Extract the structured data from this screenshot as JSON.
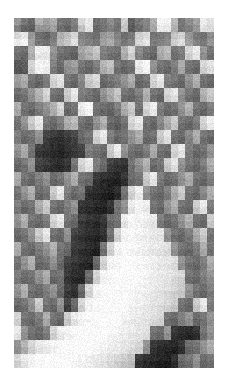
{
  "figure": {
    "kind": "grayscale-raster-heatmap",
    "background_color": "#ffffff",
    "origin_x_px": 14,
    "origin_y_px": 18,
    "width_px": 200,
    "height_px": 350,
    "cell_width_px": 7.14,
    "cell_height_px": 7.0,
    "columns": 28,
    "rows": 50,
    "noise_amplitude": 14,
    "title": "",
    "caption": "",
    "axis_labels": [],
    "tick_labels": [],
    "legend": []
  },
  "chart_data": {
    "type": "heatmap",
    "title": "",
    "xlabel": "",
    "ylabel": "",
    "colormap": "gray",
    "vmin": 0,
    "vmax": 255,
    "grid": false,
    "legend_position": "none",
    "xticklabels": [],
    "yticklabels": [],
    "ncols": 28,
    "nrows": 50,
    "note": "Grayscale intensity values 0-255 per cell; 0 = black, 255 = white.",
    "values": [
      [
        150,
        120,
        105,
        180,
        160,
        175,
        120,
        110,
        130,
        215,
        235,
        110,
        120,
        140,
        120,
        205,
        95,
        120,
        135,
        175,
        245,
        240,
        185,
        120,
        140,
        160,
        235,
        225
      ],
      [
        130,
        100,
        95,
        150,
        145,
        160,
        110,
        100,
        120,
        190,
        225,
        105,
        115,
        130,
        115,
        195,
        90,
        110,
        125,
        165,
        235,
        230,
        175,
        115,
        130,
        150,
        225,
        215
      ],
      [
        215,
        230,
        150,
        110,
        100,
        120,
        175,
        190,
        215,
        130,
        120,
        110,
        150,
        160,
        130,
        110,
        120,
        205,
        220,
        115,
        120,
        130,
        195,
        210,
        150,
        120,
        110,
        140
      ],
      [
        235,
        240,
        160,
        120,
        110,
        130,
        185,
        200,
        225,
        140,
        130,
        120,
        160,
        170,
        140,
        120,
        130,
        215,
        230,
        125,
        130,
        140,
        205,
        220,
        160,
        130,
        120,
        150
      ],
      [
        120,
        110,
        180,
        240,
        235,
        150,
        120,
        110,
        105,
        165,
        180,
        200,
        130,
        120,
        115,
        180,
        215,
        140,
        120,
        110,
        175,
        190,
        120,
        130,
        215,
        235,
        150,
        120
      ],
      [
        110,
        100,
        170,
        230,
        225,
        140,
        110,
        100,
        95,
        155,
        170,
        190,
        120,
        110,
        105,
        170,
        205,
        130,
        110,
        100,
        165,
        180,
        110,
        120,
        205,
        225,
        140,
        110
      ],
      [
        90,
        95,
        215,
        245,
        240,
        130,
        110,
        150,
        160,
        120,
        110,
        130,
        180,
        195,
        120,
        110,
        120,
        235,
        245,
        150,
        120,
        110,
        130,
        175,
        120,
        110,
        215,
        230
      ],
      [
        85,
        90,
        205,
        240,
        235,
        120,
        100,
        140,
        150,
        110,
        100,
        120,
        170,
        185,
        110,
        100,
        110,
        225,
        240,
        140,
        110,
        100,
        120,
        165,
        110,
        100,
        205,
        220
      ],
      [
        160,
        175,
        120,
        110,
        130,
        215,
        230,
        120,
        110,
        140,
        205,
        220,
        110,
        120,
        130,
        150,
        175,
        110,
        120,
        215,
        235,
        130,
        120,
        110,
        150,
        180,
        120,
        110
      ],
      [
        150,
        165,
        110,
        100,
        120,
        205,
        220,
        110,
        100,
        130,
        195,
        210,
        100,
        110,
        120,
        140,
        165,
        100,
        110,
        205,
        225,
        120,
        110,
        100,
        140,
        170,
        110,
        100
      ],
      [
        110,
        120,
        150,
        180,
        215,
        120,
        110,
        205,
        235,
        130,
        120,
        110,
        150,
        175,
        200,
        120,
        110,
        130,
        180,
        120,
        110,
        215,
        230,
        150,
        120,
        110,
        180,
        205
      ],
      [
        100,
        110,
        140,
        170,
        205,
        110,
        100,
        195,
        225,
        120,
        110,
        100,
        140,
        165,
        190,
        110,
        100,
        120,
        170,
        110,
        100,
        205,
        220,
        140,
        110,
        100,
        170,
        195
      ],
      [
        175,
        120,
        110,
        130,
        150,
        180,
        215,
        110,
        120,
        235,
        245,
        120,
        110,
        105,
        130,
        175,
        205,
        120,
        215,
        240,
        130,
        110,
        120,
        150,
        180,
        120,
        110,
        130
      ],
      [
        165,
        110,
        100,
        120,
        140,
        170,
        205,
        100,
        110,
        225,
        240,
        110,
        100,
        95,
        120,
        165,
        195,
        110,
        205,
        230,
        120,
        100,
        110,
        140,
        170,
        110,
        100,
        120
      ],
      [
        120,
        150,
        205,
        235,
        120,
        110,
        130,
        175,
        190,
        120,
        110,
        150,
        180,
        110,
        100,
        120,
        215,
        235,
        120,
        110,
        140,
        175,
        205,
        120,
        110,
        130,
        215,
        240
      ],
      [
        110,
        140,
        195,
        225,
        110,
        100,
        120,
        165,
        180,
        110,
        100,
        140,
        170,
        100,
        90,
        110,
        205,
        225,
        110,
        100,
        130,
        165,
        195,
        110,
        100,
        120,
        205,
        230
      ],
      [
        130,
        110,
        120,
        150,
        70,
        60,
        55,
        65,
        75,
        110,
        120,
        215,
        235,
        130,
        110,
        120,
        150,
        175,
        110,
        120,
        205,
        230,
        120,
        110,
        140,
        175,
        120,
        110
      ],
      [
        120,
        100,
        110,
        140,
        60,
        50,
        45,
        55,
        65,
        100,
        110,
        205,
        225,
        120,
        100,
        110,
        140,
        165,
        100,
        110,
        195,
        220,
        110,
        100,
        130,
        165,
        110,
        100
      ],
      [
        150,
        175,
        120,
        65,
        55,
        45,
        40,
        50,
        60,
        70,
        130,
        120,
        110,
        205,
        235,
        150,
        120,
        110,
        130,
        175,
        120,
        110,
        215,
        235,
        130,
        110,
        120,
        150
      ],
      [
        140,
        165,
        110,
        55,
        45,
        40,
        35,
        45,
        55,
        65,
        120,
        110,
        100,
        195,
        225,
        140,
        110,
        100,
        120,
        165,
        110,
        100,
        205,
        225,
        120,
        100,
        110,
        140
      ],
      [
        110,
        120,
        150,
        70,
        60,
        50,
        45,
        55,
        120,
        215,
        235,
        130,
        110,
        70,
        60,
        55,
        120,
        150,
        180,
        110,
        120,
        205,
        230,
        150,
        120,
        110,
        130,
        175
      ],
      [
        100,
        110,
        140,
        60,
        50,
        45,
        40,
        50,
        110,
        205,
        225,
        120,
        100,
        60,
        50,
        45,
        110,
        140,
        170,
        100,
        110,
        195,
        220,
        140,
        110,
        100,
        120,
        165
      ],
      [
        175,
        120,
        110,
        130,
        150,
        110,
        120,
        150,
        180,
        120,
        110,
        60,
        50,
        45,
        40,
        55,
        110,
        120,
        205,
        235,
        130,
        110,
        120,
        150,
        175,
        120,
        110,
        130
      ],
      [
        165,
        110,
        100,
        120,
        140,
        100,
        110,
        140,
        170,
        110,
        100,
        50,
        40,
        35,
        30,
        45,
        100,
        110,
        195,
        225,
        120,
        100,
        110,
        140,
        165,
        110,
        100,
        120
      ],
      [
        120,
        150,
        180,
        110,
        120,
        205,
        235,
        130,
        110,
        120,
        55,
        45,
        40,
        35,
        50,
        120,
        215,
        240,
        150,
        120,
        110,
        130,
        175,
        205,
        120,
        110,
        140,
        175
      ],
      [
        110,
        140,
        170,
        100,
        110,
        195,
        225,
        120,
        100,
        110,
        45,
        35,
        30,
        25,
        40,
        110,
        205,
        230,
        140,
        110,
        100,
        120,
        165,
        195,
        110,
        100,
        130,
        165
      ],
      [
        130,
        110,
        120,
        175,
        205,
        120,
        110,
        130,
        150,
        60,
        50,
        45,
        40,
        55,
        120,
        150,
        235,
        245,
        240,
        120,
        110,
        150,
        180,
        120,
        110,
        205,
        235,
        130
      ],
      [
        120,
        100,
        110,
        165,
        195,
        110,
        100,
        120,
        140,
        50,
        40,
        35,
        30,
        45,
        110,
        140,
        225,
        240,
        230,
        110,
        100,
        140,
        170,
        110,
        100,
        195,
        225,
        120
      ],
      [
        150,
        180,
        120,
        110,
        130,
        215,
        235,
        120,
        110,
        65,
        55,
        50,
        60,
        110,
        120,
        235,
        250,
        245,
        240,
        235,
        130,
        110,
        120,
        150,
        180,
        120,
        110,
        205
      ],
      [
        140,
        170,
        110,
        100,
        120,
        205,
        225,
        110,
        100,
        55,
        45,
        40,
        50,
        100,
        110,
        225,
        245,
        240,
        230,
        225,
        120,
        100,
        110,
        140,
        170,
        110,
        100,
        195
      ],
      [
        110,
        120,
        150,
        205,
        235,
        120,
        110,
        150,
        70,
        60,
        50,
        45,
        55,
        120,
        215,
        245,
        250,
        245,
        240,
        235,
        230,
        150,
        120,
        110,
        130,
        175,
        205,
        120
      ],
      [
        100,
        110,
        140,
        195,
        225,
        110,
        100,
        140,
        60,
        50,
        40,
        35,
        45,
        110,
        205,
        240,
        245,
        240,
        235,
        230,
        225,
        140,
        110,
        100,
        120,
        165,
        195,
        110
      ],
      [
        175,
        120,
        110,
        130,
        150,
        180,
        120,
        110,
        65,
        55,
        45,
        40,
        120,
        215,
        245,
        250,
        250,
        245,
        240,
        235,
        230,
        225,
        150,
        120,
        110,
        130,
        175,
        120
      ],
      [
        165,
        110,
        100,
        120,
        140,
        170,
        110,
        100,
        55,
        45,
        35,
        30,
        110,
        205,
        240,
        245,
        245,
        240,
        235,
        230,
        225,
        215,
        140,
        110,
        100,
        120,
        165,
        110
      ],
      [
        120,
        150,
        180,
        110,
        120,
        150,
        110,
        70,
        60,
        50,
        45,
        110,
        215,
        245,
        250,
        250,
        250,
        250,
        245,
        240,
        235,
        230,
        225,
        150,
        120,
        110,
        130,
        175
      ],
      [
        110,
        140,
        170,
        100,
        110,
        140,
        100,
        60,
        50,
        40,
        35,
        100,
        205,
        240,
        245,
        250,
        250,
        245,
        240,
        235,
        230,
        225,
        215,
        140,
        110,
        100,
        120,
        165
      ],
      [
        130,
        110,
        120,
        150,
        175,
        110,
        120,
        60,
        50,
        45,
        110,
        215,
        245,
        250,
        250,
        250,
        250,
        250,
        245,
        240,
        235,
        230,
        225,
        215,
        120,
        110,
        130,
        150
      ],
      [
        120,
        100,
        110,
        140,
        165,
        100,
        110,
        50,
        40,
        35,
        100,
        205,
        240,
        245,
        250,
        250,
        250,
        250,
        240,
        235,
        230,
        225,
        215,
        205,
        110,
        100,
        120,
        140
      ],
      [
        150,
        180,
        120,
        110,
        130,
        150,
        110,
        65,
        55,
        110,
        215,
        245,
        250,
        250,
        250,
        250,
        250,
        245,
        240,
        235,
        230,
        225,
        215,
        205,
        150,
        120,
        110,
        130
      ],
      [
        140,
        170,
        110,
        100,
        120,
        140,
        100,
        55,
        45,
        100,
        205,
        240,
        245,
        250,
        250,
        250,
        245,
        240,
        235,
        230,
        225,
        215,
        205,
        195,
        140,
        110,
        100,
        120
      ],
      [
        110,
        120,
        150,
        205,
        120,
        110,
        150,
        70,
        110,
        215,
        245,
        250,
        250,
        250,
        250,
        250,
        245,
        240,
        235,
        230,
        225,
        215,
        205,
        120,
        110,
        205,
        235,
        130
      ],
      [
        100,
        110,
        140,
        195,
        110,
        100,
        140,
        60,
        100,
        205,
        240,
        245,
        250,
        250,
        250,
        250,
        240,
        235,
        230,
        225,
        215,
        205,
        195,
        110,
        100,
        195,
        225,
        120
      ],
      [
        215,
        120,
        110,
        130,
        175,
        120,
        110,
        205,
        235,
        245,
        250,
        250,
        250,
        250,
        250,
        245,
        240,
        235,
        230,
        225,
        215,
        120,
        110,
        130,
        150,
        110,
        120,
        150
      ],
      [
        205,
        110,
        100,
        120,
        165,
        110,
        100,
        195,
        225,
        240,
        245,
        250,
        250,
        250,
        250,
        240,
        235,
        230,
        225,
        215,
        205,
        110,
        100,
        120,
        140,
        100,
        110,
        140
      ],
      [
        235,
        150,
        120,
        110,
        130,
        215,
        240,
        245,
        250,
        250,
        250,
        250,
        250,
        250,
        245,
        240,
        235,
        230,
        225,
        120,
        110,
        150,
        60,
        50,
        45,
        55,
        120,
        150
      ],
      [
        225,
        140,
        110,
        100,
        120,
        205,
        230,
        240,
        245,
        250,
        250,
        250,
        250,
        245,
        240,
        235,
        230,
        225,
        215,
        110,
        100,
        140,
        50,
        40,
        35,
        45,
        110,
        140
      ],
      [
        150,
        180,
        215,
        235,
        240,
        245,
        250,
        250,
        250,
        250,
        250,
        250,
        245,
        240,
        235,
        230,
        225,
        215,
        150,
        60,
        50,
        45,
        40,
        55,
        110,
        120,
        150,
        175
      ],
      [
        140,
        170,
        205,
        225,
        230,
        240,
        245,
        250,
        250,
        250,
        250,
        245,
        240,
        235,
        230,
        225,
        215,
        205,
        140,
        50,
        40,
        35,
        30,
        45,
        100,
        110,
        140,
        165
      ],
      [
        215,
        235,
        245,
        250,
        250,
        250,
        250,
        250,
        250,
        245,
        240,
        235,
        230,
        225,
        215,
        205,
        195,
        60,
        50,
        45,
        40,
        35,
        50,
        110,
        120,
        150,
        110,
        120
      ],
      [
        205,
        225,
        240,
        245,
        250,
        250,
        250,
        250,
        245,
        240,
        235,
        230,
        225,
        215,
        205,
        195,
        185,
        50,
        40,
        35,
        30,
        25,
        40,
        100,
        110,
        140,
        100,
        110
      ]
    ]
  }
}
